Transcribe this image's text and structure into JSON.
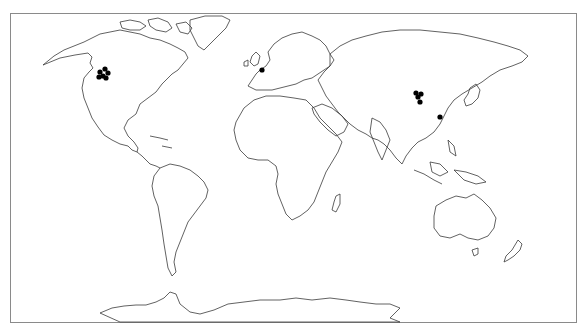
{
  "map": {
    "projection": "equirectangular-world",
    "frame": {
      "x": 10,
      "y": 13,
      "width": 567,
      "height": 310,
      "border_color": "#8a8a8a"
    },
    "coastline_color": "#3a3a3a",
    "marker_color": "#000000",
    "marker_groups": [
      {
        "name": "north-america-cluster",
        "region": "Western Canada / Pacific Northwest",
        "points": [
          [
            100,
            72
          ],
          [
            105,
            69
          ],
          [
            108,
            73
          ],
          [
            103,
            76
          ],
          [
            106,
            78
          ],
          [
            99,
            77
          ]
        ]
      },
      {
        "name": "europe-marker",
        "region": "Netherlands / Belgium",
        "points": [
          [
            262,
            70
          ]
        ]
      },
      {
        "name": "china-cluster",
        "region": "Northern China",
        "points": [
          [
            416,
            93
          ],
          [
            421,
            94
          ],
          [
            418,
            97
          ],
          [
            420,
            102
          ]
        ]
      },
      {
        "name": "east-china-marker",
        "region": "Eastern China coast",
        "points": [
          [
            440,
            117
          ]
        ]
      }
    ]
  }
}
